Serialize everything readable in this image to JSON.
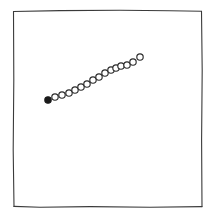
{
  "figure": {
    "kind": "hand-drawn-scatter-plot",
    "width": 211,
    "height": 221,
    "background_color": "#ffffff",
    "frame": {
      "stroke_color": "#3a3a3a",
      "left": 13,
      "top": 10,
      "right": 202,
      "bottom": 207,
      "style": "hand-drawn-rectangle"
    },
    "title": "",
    "caption": ""
  },
  "chart_data": {
    "type": "scatter",
    "title": "",
    "subtitle": "",
    "xlabel": "",
    "ylabel": "",
    "grid": false,
    "legend": "none",
    "legend_entries": [],
    "annotations": [],
    "axis_ticks": {
      "x": [],
      "y": []
    },
    "xlim": [
      13,
      202
    ],
    "ylim": [
      207,
      10
    ],
    "marker": {
      "shape": "circle",
      "style": "open",
      "radius_px": 3.2,
      "face_color": "#ffffff",
      "edge_color": "#2b2b2b"
    },
    "series": [
      {
        "name": "points",
        "point_count": 16,
        "trend": "increasing",
        "x": [
          48,
          55,
          62,
          69,
          75,
          81,
          87,
          93,
          99,
          105,
          111,
          116,
          121,
          127,
          133,
          140
        ],
        "y": [
          100,
          97,
          95,
          93,
          90,
          87,
          84,
          80,
          77,
          73,
          70,
          68,
          66,
          65,
          62,
          57
        ],
        "filled_index": 0
      }
    ]
  }
}
